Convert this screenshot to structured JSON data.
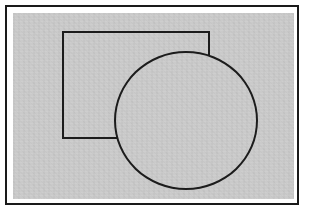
{
  "diagram": {
    "background_color": "#ffffff",
    "canvas_fill_color": "#c9c9c9",
    "frame_stroke_color": "#1a1a1a",
    "shape_stroke_color": "#1c1c1c",
    "shapes": {
      "frame": {
        "type": "rect",
        "x": 5,
        "y": 5,
        "width": 294,
        "height": 200,
        "fill": "#ffffff",
        "stroke": "#1a1a1a",
        "stroke_width": 2
      },
      "canvas": {
        "type": "rect",
        "x": 13,
        "y": 13,
        "width": 281,
        "height": 186,
        "fill": "#c9c9c9",
        "stroke": "",
        "stroke_width": 0
      },
      "rectangle": {
        "type": "rect",
        "x": 62,
        "y": 31,
        "width": 148,
        "height": 108,
        "fill": "",
        "stroke": "#1c1c1c",
        "stroke_width": 2
      },
      "circle": {
        "type": "ellipse",
        "x": 114,
        "y": 51,
        "width": 144,
        "height": 139,
        "fill": "#c9c9c9",
        "stroke": "#1c1c1c",
        "stroke_width": 2
      }
    }
  }
}
